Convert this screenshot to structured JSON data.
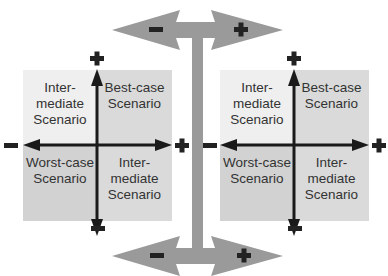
{
  "diagram": {
    "left_panel": {
      "top_left": "Inter-\nmediate\nScenario",
      "top_right": "Best-case\nScenario",
      "bottom_left": "Worst-case\nScenario",
      "bottom_right": "Inter-\nmediate\nScenario"
    },
    "right_panel": {
      "top_left": "Inter-\nmediate\nScenario",
      "top_right": "Best-case\nScenario",
      "bottom_left": "Worst-case\nScenario",
      "bottom_right": "Inter-\nmediate\nScenario"
    },
    "axis_symbols": {
      "plus": "+",
      "minus": "−"
    },
    "colors": {
      "quadrant_light": "#efefef",
      "quadrant_dark": "#d4d4d4",
      "connector_gray": "#9a9a9a",
      "axis": "#1a1a1a"
    }
  }
}
